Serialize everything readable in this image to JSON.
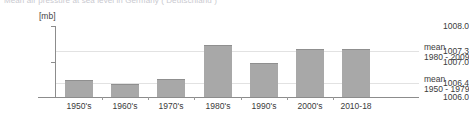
{
  "chart_data": {
    "type": "bar",
    "title": "Mean air pressure at sea level in Germany ( Deutschland )",
    "unit_label": "[mb]",
    "xlabel": "",
    "ylabel": "",
    "ylim": [
      1006.0,
      1008.0
    ],
    "grid": true,
    "legend_position": "right",
    "categories": [
      "1950's",
      "1960's",
      "1970's",
      "1980's",
      "1990's",
      "2000's",
      "2010-18"
    ],
    "values": [
      1006.47,
      1006.38,
      1006.52,
      1007.46,
      1006.95,
      1007.36,
      1007.35
    ],
    "ytick_labels": [
      "1008.0",
      "1007.3",
      "1007.0",
      "1006.4",
      "1006.0"
    ],
    "ytick_values": [
      1008.0,
      1007.3,
      1007.0,
      1006.4,
      1006.0
    ],
    "gridlines": [
      {
        "value": 1007.3,
        "label": "mean 1980 - 2009"
      },
      {
        "value": 1006.4,
        "label": "mean 1950 - 1979"
      }
    ],
    "annotations": [
      {
        "line1": "mean",
        "line2": "1980 - 2009",
        "value": 1007.3
      },
      {
        "line1": "mean",
        "line2": "1950 - 1979",
        "value": 1006.4
      }
    ],
    "bar_color": "#a8a8a8",
    "gridline_color": "#e2e2e2",
    "axis_color": "#8c8c8c",
    "text_color": "#3b3b3b"
  }
}
